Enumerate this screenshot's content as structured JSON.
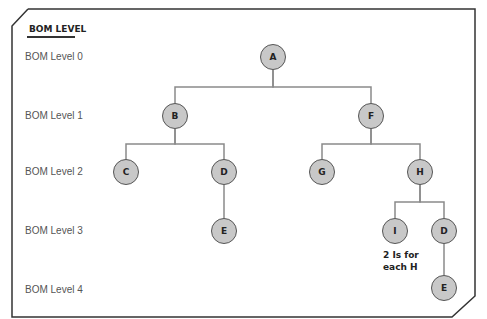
{
  "title": "BOM LEVEL",
  "levels": [
    {
      "label": "BOM Level 0",
      "y": 57
    },
    {
      "label": "BOM Level 1",
      "y": 116
    },
    {
      "label": "BOM Level 2",
      "y": 172
    },
    {
      "label": "BOM Level 3",
      "y": 231
    },
    {
      "label": "BOM Level 4",
      "y": 290
    }
  ],
  "nodes": [
    {
      "id": "A",
      "label": "A",
      "x": 273,
      "y": 57
    },
    {
      "id": "B",
      "label": "B",
      "x": 175,
      "y": 116
    },
    {
      "id": "F",
      "label": "F",
      "x": 371,
      "y": 116
    },
    {
      "id": "C",
      "label": "C",
      "x": 126,
      "y": 172
    },
    {
      "id": "D1",
      "label": "D",
      "x": 224,
      "y": 172
    },
    {
      "id": "G",
      "label": "G",
      "x": 322,
      "y": 172
    },
    {
      "id": "H",
      "label": "H",
      "x": 420,
      "y": 172
    },
    {
      "id": "E1",
      "label": "E",
      "x": 224,
      "y": 231
    },
    {
      "id": "I",
      "label": "I",
      "x": 395,
      "y": 231
    },
    {
      "id": "D2",
      "label": "D",
      "x": 444,
      "y": 231
    },
    {
      "id": "E2",
      "label": "E",
      "x": 444,
      "y": 288
    }
  ],
  "edges": [
    [
      "A",
      "B"
    ],
    [
      "A",
      "F"
    ],
    [
      "B",
      "C"
    ],
    [
      "B",
      "D1"
    ],
    [
      "F",
      "G"
    ],
    [
      "F",
      "H"
    ],
    [
      "D1",
      "E1"
    ],
    [
      "H",
      "I"
    ],
    [
      "H",
      "D2"
    ],
    [
      "D2",
      "E2"
    ]
  ],
  "note": {
    "line1": "2 Is for",
    "line2": "each H"
  },
  "colors": {
    "node_fill": "#c8c8c8",
    "node_stroke": "#555555",
    "edge": "#888888",
    "frame": "#333333"
  }
}
